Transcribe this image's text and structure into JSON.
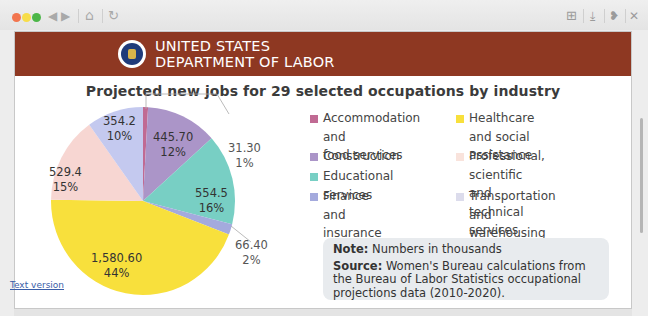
{
  "browser": {
    "traffic_lights": [
      "close",
      "minimize",
      "maximize"
    ],
    "nav_icons": {
      "back": "◀",
      "forward": "▶",
      "home": "⌂",
      "reload": "↻"
    },
    "tool_icons": {
      "add_tab": "⊞",
      "download": "⤓",
      "extensions": "❥",
      "close": "✕"
    }
  },
  "banner": {
    "line1": "UNITED STATES",
    "line2": "DEPARTMENT OF LABOR",
    "color": "#8e3822"
  },
  "chart": {
    "title": "Projected new jobs for 29 selected occupations by industry",
    "text_version_link": "Text version",
    "note_label": "Note:",
    "note_text": " Numbers in thousands",
    "source_label": "Source:",
    "source_text": " Women's Bureau calculations from the Bureau of Labor Statistics occupational projections data (2010-2020)."
  },
  "chart_data": {
    "type": "pie",
    "title": "Projected new jobs for 29 selected occupations by industry",
    "unit": "thousands",
    "start_angle": "12 o'clock, clockwise",
    "legend_position": "right",
    "categories": [
      "Accommodation and food services",
      "Construction",
      "Educational services",
      "Finance and insurance",
      "Healthcare and social assistance",
      "Professional, scientific and technical services",
      "Transportation and warehousing"
    ],
    "values": [
      31.3,
      445.7,
      554.5,
      66.4,
      1580.6,
      529.4,
      354.2
    ],
    "value_labels": [
      "31.30",
      "445.70",
      "554.5",
      "66.40",
      "1,580.60",
      "529.4",
      "354.2"
    ],
    "percent_labels": [
      "1%",
      "12%",
      "16%",
      "2%",
      "44%",
      "15%",
      "10%"
    ],
    "colors": [
      "#c06a93",
      "#ab95c8",
      "#78cfc4",
      "#a4aadd",
      "#f8e03c",
      "#f7d6d2",
      "#c4c9ef"
    ]
  },
  "legend": [
    {
      "label_line1": "Accommodation and",
      "label_line2": "food services",
      "color": "#c06a93"
    },
    {
      "label_line1": "Construction",
      "label_line2": "",
      "color": "#ab95c8"
    },
    {
      "label_line1": "Educational services",
      "label_line2": "",
      "color": "#78cfc4"
    },
    {
      "label_line1": "Finance and",
      "label_line2": "insurance",
      "color": "#a4aadd"
    },
    {
      "label_line1": "Healthcare and social",
      "label_line2": "assistance",
      "color": "#f8e03c"
    },
    {
      "label_line1": "Professional, scientific",
      "label_line2": "and technical services",
      "color": "#f7d6d2"
    },
    {
      "label_line1": "Transportation and",
      "label_line2": "warehousing",
      "color": "#dcdcec"
    }
  ]
}
